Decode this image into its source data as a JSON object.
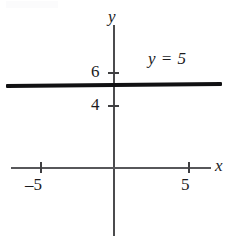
{
  "figure": {
    "width": 232,
    "height": 236,
    "background": "#ffffff",
    "line_color": "#111113",
    "axis_color": "#4b4b4d"
  },
  "axes": {
    "y_axis_label": "y",
    "x_axis_label": "x"
  },
  "ticks": {
    "y": [
      {
        "label": "6",
        "value": 6
      },
      {
        "label": "4",
        "value": 4
      }
    ],
    "x": [
      {
        "label": "–5",
        "value": -5
      },
      {
        "label": "5",
        "value": 5
      }
    ]
  },
  "annotations": {
    "equation": "y = 5"
  },
  "chart_data": {
    "type": "line",
    "title": "",
    "xlabel": "x",
    "ylabel": "y",
    "grid": false,
    "legend": "none",
    "xlim": [
      -7.8,
      7.0
    ],
    "ylim": [
      -2.3,
      9.5
    ],
    "xticks": [
      -5,
      5
    ],
    "xticklabels": [
      "–5",
      "5"
    ],
    "yticks": [
      4,
      6
    ],
    "yticklabels": [
      "4",
      "6"
    ],
    "series": [
      {
        "name": "y = 5",
        "equation": "y = 5",
        "label": "y = 5",
        "type": "horizontal-line",
        "y_value": 5,
        "x": [
          -7.5,
          7.0
        ],
        "values": [
          5,
          5
        ],
        "color": "#111113",
        "linewidth": 3
      }
    ],
    "annotations": [
      {
        "text": "y = 5",
        "x": 2.0,
        "y": 7.0
      }
    ]
  }
}
